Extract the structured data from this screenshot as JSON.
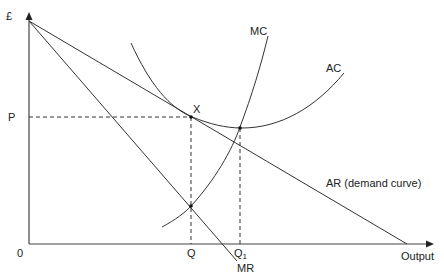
{
  "diagram": {
    "type": "monopoly long-run equilibrium (cost and revenue curves)",
    "axes": {
      "y_label": "£",
      "x_label": "Output",
      "origin_label": "0"
    },
    "curves": {
      "mc_label": "MC",
      "ac_label": "AC",
      "ar_label": "AR (demand curve)",
      "mr_label": "MR"
    },
    "points": {
      "x_label": "X",
      "price_label": "P",
      "quantity_label": "Q",
      "quantity1_label": "Q",
      "quantity1_subscript": "1"
    },
    "colors": {
      "lines": "#333333",
      "background": "#ffffff"
    }
  }
}
